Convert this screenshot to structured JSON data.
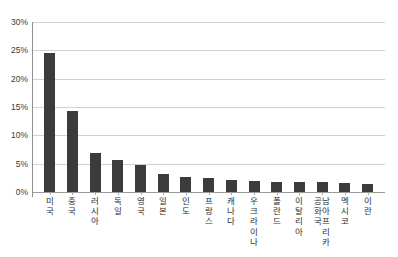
{
  "chart_data": {
    "type": "bar",
    "title": "",
    "xlabel": "",
    "ylabel": "",
    "ylim": [
      0,
      30
    ],
    "ytick_labels": [
      "30%",
      "25%",
      "20%",
      "15%",
      "10%",
      "5%",
      "0%"
    ],
    "ytick_values": [
      30,
      25,
      20,
      15,
      10,
      5,
      0
    ],
    "grid": "horizontal",
    "legend": "none",
    "value_suffix": "%",
    "categories": [
      "미국",
      "중국",
      "러시아",
      "독일",
      "영국",
      "일본",
      "인도",
      "프랑스",
      "캐나다",
      "우크라이나",
      "폴란드",
      "이탈리아",
      "남아프리카공화국",
      "멕시코",
      "이란"
    ],
    "category_columns": [
      [
        "미국"
      ],
      [
        "중국"
      ],
      [
        "러시아"
      ],
      [
        "독일"
      ],
      [
        "영국"
      ],
      [
        "일본"
      ],
      [
        "인도"
      ],
      [
        "프랑스"
      ],
      [
        "캐나다"
      ],
      [
        "우크라이나"
      ],
      [
        "폴란드"
      ],
      [
        "이탈리아"
      ],
      [
        "남아프리카",
        "공화국"
      ],
      [
        "멕시코"
      ],
      [
        "이란"
      ]
    ],
    "values": [
      24.6,
      14.3,
      6.9,
      5.7,
      4.8,
      3.2,
      2.6,
      2.4,
      2.1,
      1.9,
      1.8,
      1.7,
      1.7,
      1.6,
      1.5
    ],
    "colors": {
      "bar": "#3b3b3b",
      "gridline": "#d2d2d2",
      "axis": "#8f8f8f",
      "background": "#ffffff",
      "text": "#2e2e2e"
    }
  }
}
